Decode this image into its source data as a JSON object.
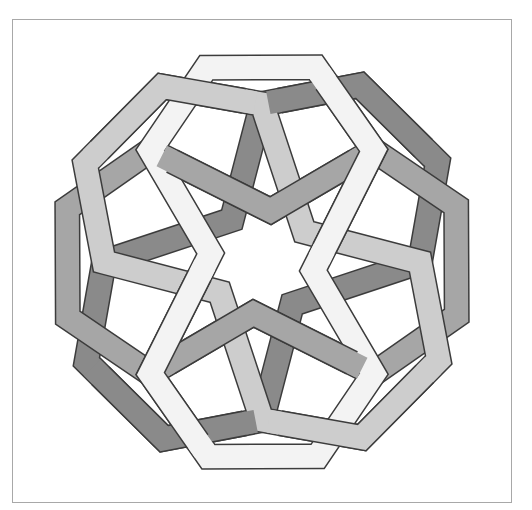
{
  "figure": {
    "frame": {
      "x": 12,
      "y": 19,
      "width": 500,
      "height": 484,
      "color": "#a8a8a8"
    },
    "center": [
      262,
      262
    ],
    "outline_color": "#3c3c3c",
    "band_width": 24,
    "star": {
      "points": 8,
      "fill": "#ffffff"
    }
  },
  "pattern": {
    "bands": [
      {
        "name": "band-dark",
        "rotation_deg": 0,
        "color": "#8a8a8a",
        "vertices": [
          [
            262,
            420
          ],
          [
            292.2,
            304.3
          ],
          [
            420,
            262
          ],
          [
            437.6,
            162.2
          ],
          [
            359.9,
            85.3
          ],
          [
            262,
            104
          ],
          [
            231.8,
            219.7
          ],
          [
            104,
            262
          ],
          [
            86.4,
            361.8
          ],
          [
            164.1,
            438.7
          ]
        ]
      },
      {
        "name": "band-medium",
        "rotation_deg": 45,
        "color": "#a6a6a6",
        "vertices": [
          [
            150.3,
            373.7
          ],
          [
            253.4,
            313.3
          ],
          [
            373.7,
            373.7
          ],
          [
            456.7,
            315.7
          ],
          [
            456.2,
            206.3
          ],
          [
            373.7,
            150.3
          ],
          [
            270.6,
            210.7
          ],
          [
            150.3,
            150.3
          ],
          [
            67.3,
            208.3
          ],
          [
            67.8,
            317.7
          ]
        ]
      },
      {
        "name": "band-light",
        "rotation_deg": 90,
        "color": "#cdcdcd",
        "vertices": [
          [
            104,
            262
          ],
          [
            219.7,
            292.2
          ],
          [
            262,
            420
          ],
          [
            361.8,
            437.6
          ],
          [
            438.7,
            359.9
          ],
          [
            420,
            262
          ],
          [
            304.3,
            231.8
          ],
          [
            262,
            104
          ],
          [
            162.2,
            86.4
          ],
          [
            85.3,
            164.1
          ]
        ]
      },
      {
        "name": "band-lightest",
        "rotation_deg": 135,
        "color": "#f3f3f3",
        "vertices": [
          [
            150.3,
            150.3
          ],
          [
            210.7,
            253.4
          ],
          [
            150.3,
            373.7
          ],
          [
            208.3,
            456.7
          ],
          [
            317.7,
            456.2
          ],
          [
            373.7,
            373.7
          ],
          [
            313.3,
            270.6
          ],
          [
            373.7,
            150.3
          ],
          [
            315.7,
            67.3
          ],
          [
            206.3,
            67.8
          ]
        ]
      }
    ],
    "over_segments": [
      {
        "band": 0,
        "from": 3,
        "to": 5
      },
      {
        "band": 0,
        "from": 8,
        "to": 10
      },
      {
        "band": 1,
        "from": 0,
        "to": 2
      },
      {
        "band": 1,
        "from": 5,
        "to": 7
      },
      {
        "band": 2,
        "from": 2,
        "to": 4
      },
      {
        "band": 2,
        "from": 7,
        "to": 9
      },
      {
        "band": 3,
        "from": 1,
        "to": 3
      },
      {
        "band": 3,
        "from": 6,
        "to": 8
      }
    ]
  }
}
